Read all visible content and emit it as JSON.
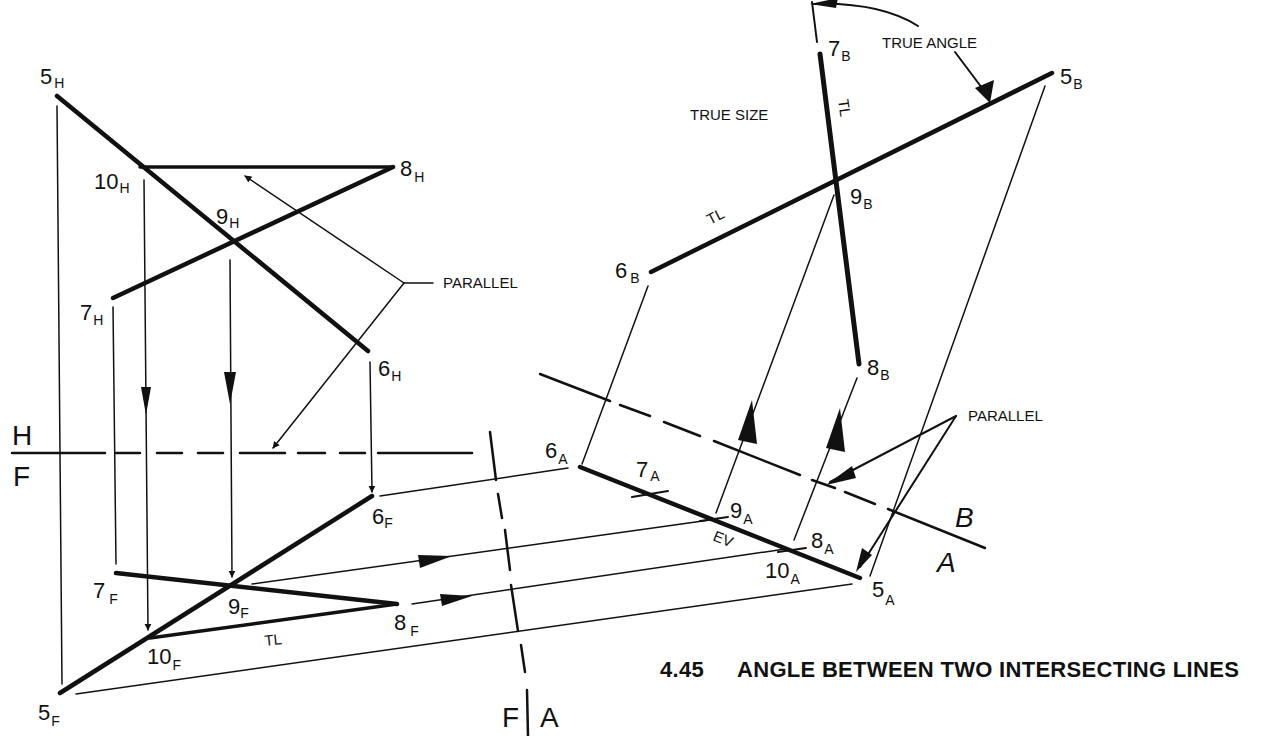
{
  "caption": {
    "number": "4.45",
    "title": "ANGLE BETWEEN TWO INTERSECTING LINES"
  },
  "annotations": {
    "true_angle": "TRUE ANGLE",
    "true_size": "TRUE SIZE",
    "parallel_left": "PARALLEL",
    "parallel_right": "PARALLEL",
    "tl_front": "TL",
    "tl_aux_b_line56": "TL",
    "tl_aux_b_line78": "TL",
    "ev": "EV"
  },
  "fold_lines": {
    "hf": {
      "top": "H",
      "bottom": "F"
    },
    "fa": {
      "left": "F",
      "right": "A"
    },
    "ab": {
      "top": "B",
      "bottom": "A"
    }
  },
  "points": {
    "horizontal": [
      {
        "num": "5",
        "sub": "H"
      },
      {
        "num": "10",
        "sub": "H"
      },
      {
        "num": "8",
        "sub": "H"
      },
      {
        "num": "9",
        "sub": "H"
      },
      {
        "num": "7",
        "sub": "H"
      },
      {
        "num": "6",
        "sub": "H"
      }
    ],
    "front": [
      {
        "num": "6",
        "sub": "F"
      },
      {
        "num": "7",
        "sub": "F"
      },
      {
        "num": "9",
        "sub": "F"
      },
      {
        "num": "8",
        "sub": "F"
      },
      {
        "num": "10",
        "sub": "F"
      },
      {
        "num": "5",
        "sub": "F"
      }
    ],
    "auxiliary_a": [
      {
        "num": "6",
        "sub": "A"
      },
      {
        "num": "7",
        "sub": "A"
      },
      {
        "num": "9",
        "sub": "A"
      },
      {
        "num": "8",
        "sub": "A"
      },
      {
        "num": "10",
        "sub": "A"
      },
      {
        "num": "5",
        "sub": "A"
      }
    ],
    "auxiliary_b": [
      {
        "num": "7",
        "sub": "B"
      },
      {
        "num": "5",
        "sub": "B"
      },
      {
        "num": "9",
        "sub": "B"
      },
      {
        "num": "6",
        "sub": "B"
      },
      {
        "num": "8",
        "sub": "B"
      }
    ]
  }
}
